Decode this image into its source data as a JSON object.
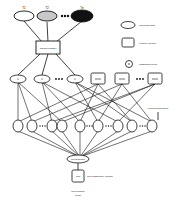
{
  "top_nodes": [
    {
      "label": "T1",
      "fill": "#ffffff"
    },
    {
      "label": "T2",
      "fill": "#c8c8c8"
    },
    {
      "label": "Tn",
      "fill": "#111111"
    }
  ],
  "central_box": {
    "label": "Combined Dataset"
  },
  "legend": [
    {
      "shape": "ellipse",
      "label": "Intermediate Data"
    },
    {
      "shape": "box",
      "label": "Learning Algorithm"
    },
    {
      "shape": "circle-dot",
      "label": "Classification Result"
    }
  ],
  "data_nodes": [
    {
      "label": "D1"
    },
    {
      "label": "D2"
    },
    {
      "label": "Dn"
    }
  ],
  "algorithm_boxes": [
    {
      "label": "L1"
    },
    {
      "label": "L2"
    },
    {
      "label": "Ln"
    }
  ],
  "side_label": "Learning Combinations",
  "model_nodes": [
    {
      "label": "M1-1"
    },
    {
      "label": "M1-2"
    },
    {
      "label": "M1-n"
    },
    {
      "label": "M2-1"
    },
    {
      "label": "M2-n"
    },
    {
      "label": "Mn-1"
    },
    {
      "label": "Mn-2"
    },
    {
      "label": "Mn-3"
    },
    {
      "label": "Mn-n"
    }
  ],
  "ensemble_node": {
    "label": "Meta Ensemble"
  },
  "final_box": {
    "label": "Meta",
    "side_label": "Meta Classification Algorithm"
  },
  "bottom_label": {
    "line1": "Meta-Classifier",
    "line2": "Result"
  }
}
